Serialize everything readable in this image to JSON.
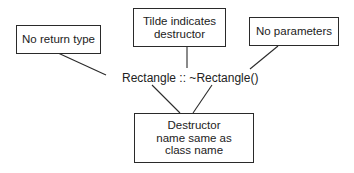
{
  "diagram": {
    "center_label": "Rectangle :: ~Rectangle()",
    "callouts": [
      {
        "id": "no-return-type",
        "text": "No return type"
      },
      {
        "id": "tilde",
        "text": "Tilde indicates destructor"
      },
      {
        "id": "no-parameters",
        "text": "No parameters"
      },
      {
        "id": "destructor-name",
        "text": "Destructor name same as class name"
      }
    ],
    "line_color": "#2a2a2a"
  }
}
